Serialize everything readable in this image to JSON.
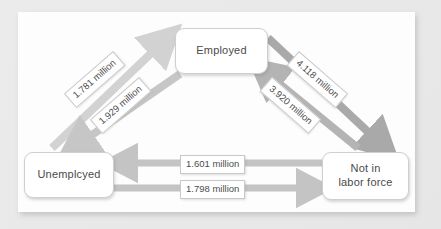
{
  "figure": {
    "background_color": "#e9e9e9",
    "panel_color": "#fdfdfd"
  },
  "nodes": [
    {
      "id": "employed",
      "label": "Employed",
      "position": "top-center"
    },
    {
      "id": "unemployed",
      "label": "Unemplcyed",
      "position": "bottom-left"
    },
    {
      "id": "not-in-labor-force",
      "label_line1": "Not in",
      "label_line2": "labor force",
      "position": "bottom-right"
    }
  ],
  "edges": [
    {
      "id": "unemployed-to-employed",
      "from": "unemployed",
      "to": "employed",
      "label": "1.781 million",
      "value": 1.781,
      "unit": "million",
      "color": "#d2d2d2",
      "rotation_deg": -41
    },
    {
      "id": "employed-to-unemployed",
      "from": "employed",
      "to": "unemployed",
      "label": "1.929 million",
      "value": 1.929,
      "unit": "million",
      "color": "#c6c6c6",
      "rotation_deg": -41
    },
    {
      "id": "employed-to-not-in-labor-force",
      "from": "employed",
      "to": "not-in-labor-force",
      "label": "4.118 million",
      "value": 4.118,
      "unit": "million",
      "color": "#a9a9a9",
      "rotation_deg": 41
    },
    {
      "id": "not-in-labor-force-to-employed",
      "from": "not-in-labor-force",
      "to": "employed",
      "label": "3.920 million",
      "value": 3.92,
      "unit": "million",
      "color": "#b4b4b4",
      "rotation_deg": 41
    },
    {
      "id": "not-in-labor-force-to-unemployed",
      "from": "not-in-labor-force",
      "to": "unemployed",
      "label": "1.601 million",
      "value": 1.601,
      "unit": "million",
      "color": "#c4c4c4",
      "rotation_deg": 0
    },
    {
      "id": "unemployed-to-not-in-labor-force",
      "from": "unemployed",
      "to": "not-in-labor-force",
      "label": "1.798 million",
      "value": 1.798,
      "unit": "million",
      "color": "#c4c4c4",
      "rotation_deg": 0
    }
  ]
}
